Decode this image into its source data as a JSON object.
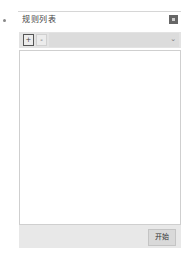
{
  "panel": {
    "title": "规则列表",
    "close_icon": "square-close-icon"
  },
  "toolbar": {
    "add_label": "+",
    "remove_label": "-",
    "dropdown_value": "",
    "dropdown_icon": "chevron-down-icon"
  },
  "list": {
    "items": []
  },
  "footer": {
    "start_label": "开始"
  }
}
